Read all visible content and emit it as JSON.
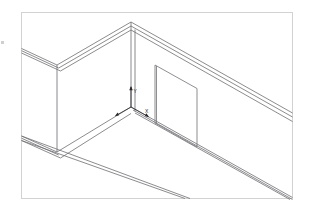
{
  "document": {
    "type": "isometric-line-drawing",
    "subject": "room-corner-with-panel",
    "background_color": "#ffffff",
    "line_color": "#6e6e72",
    "frame_color": "#d2d2d2"
  },
  "frame": {
    "name": "drawing-border",
    "x": 21,
    "y": 12,
    "width": 272,
    "height": 187
  },
  "axes": {
    "origin": {
      "x": 131,
      "y": 107
    },
    "labels": {
      "y": "Y",
      "x": "X"
    },
    "y_label_pos": {
      "x": 134,
      "y": 91
    },
    "x_label_pos": {
      "x": 149,
      "y": 113
    }
  },
  "geometry": {
    "corner_apex": {
      "x": 131,
      "y": 22
    },
    "left_wall_outer_corner": {
      "x": 57,
      "y": 65
    },
    "left_wall_base": {
      "x": 57,
      "y": 152
    },
    "inner_corner_base": {
      "x": 131,
      "y": 107
    },
    "panel": {
      "name": "vertical-panel",
      "top_left": {
        "x": 155,
        "y": 65
      },
      "top_right": {
        "x": 197,
        "y": 88
      },
      "bottom_right": {
        "x": 197,
        "y": 147
      },
      "bottom_left": {
        "x": 155,
        "y": 123
      }
    }
  },
  "elements": {
    "left_wall": "left-wall",
    "right_wall": "right-wall",
    "floor": "floor-plane",
    "panel": "interior-panel",
    "front_floor_edge": "front-floor-edge"
  }
}
